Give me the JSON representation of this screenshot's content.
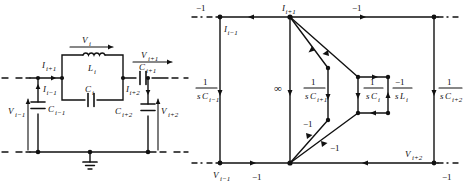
{
  "figure": {
    "kind": "two-panel-figure",
    "panels": [
      "ladder-network-circuit",
      "signal-flow-graph"
    ]
  },
  "circuit": {
    "title": "",
    "labels": {
      "v_i": "V",
      "v_i_sub": "i",
      "v_ip1": "V",
      "v_ip1_sub": "i+1",
      "v_im1": "V",
      "v_im1_sub": "i−1",
      "v_ip2": "V",
      "v_ip2_sub": "i+2",
      "i_ip1": "I",
      "i_ip1_sub": "i+1",
      "i_im1": "I",
      "i_im1_sub": "i−1",
      "i_ip2": "I",
      "i_ip2_sub": "i+2",
      "l_i": "L",
      "l_i_sub": "i",
      "c_i": "C",
      "c_i_sub": "i",
      "c_im1": "C",
      "c_im1_sub": "i−1",
      "c_ip1": "C",
      "c_ip1_sub": "i+1",
      "c_ip2": "C",
      "c_ip2_sub": "i+2"
    },
    "components": [
      {
        "name": "inductor-Li",
        "type": "inductor",
        "label": "L",
        "sub": "i"
      },
      {
        "name": "capacitor-Ci",
        "type": "capacitor",
        "label": "C",
        "sub": "i"
      },
      {
        "name": "capacitor-Cim1",
        "type": "capacitor",
        "label": "C",
        "sub": "i−1"
      },
      {
        "name": "capacitor-Cip1",
        "type": "capacitor",
        "label": "C",
        "sub": "i+1"
      },
      {
        "name": "capacitor-Cip2",
        "type": "capacitor",
        "label": "C",
        "sub": "i+2"
      }
    ]
  },
  "flowgraph": {
    "node_labels": {
      "top_left": "I",
      "top_left_sub": "i−1",
      "top_mid": "I",
      "top_mid_sub": "i+1",
      "bottom_left": "V",
      "bottom_left_sub": "i−1",
      "bottom_right": "V",
      "bottom_right_sub": "i+2"
    },
    "branch_gains": {
      "top_left_edge": "−1",
      "top_right_edge": "−1",
      "bottom_left_edge": "−1",
      "bottom_right_edge": "−1",
      "diag_mid": "−1",
      "diag_low": "−1",
      "infinity": "∞"
    },
    "transmittances": [
      {
        "name": "left-branch",
        "num": "1",
        "den_s": "s",
        "den_c": "C",
        "den_sub": "i−1"
      },
      {
        "name": "mid-branch",
        "num": "1",
        "den_s": "s",
        "den_c": "C",
        "den_sub": "i+1"
      },
      {
        "name": "loop-c-branch",
        "num": "1",
        "den_s": "s",
        "den_c": "C",
        "den_sub": "i"
      },
      {
        "name": "loop-l-branch",
        "num": "−1",
        "den_s": "s",
        "den_c": "L",
        "den_sub": "i"
      },
      {
        "name": "right-branch",
        "num": "1",
        "den_s": "s",
        "den_c": "C",
        "den_sub": "i+2"
      }
    ]
  },
  "style": {
    "ink": "#111111",
    "background": "#ffffff"
  }
}
